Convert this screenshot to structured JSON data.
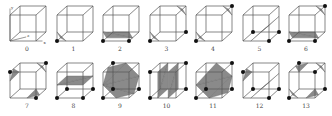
{
  "figure": {
    "axis_labels": {
      "x": "x",
      "y": "y",
      "z": "z"
    },
    "colors": {
      "edge": "#555555",
      "fill": "#8a8a8a",
      "vertex": "#111111",
      "label": "#444444"
    },
    "cases": [
      {
        "label": "0",
        "col": 0,
        "row": 0,
        "vertices": [],
        "tris": []
      },
      {
        "label": "1",
        "col": 1,
        "row": 0,
        "vertices": [
          0
        ],
        "tris": [
          [
            [
              0,
              0.35,
              0
            ],
            [
              0.35,
              0,
              0
            ],
            [
              0,
              0,
              0.35
            ]
          ]
        ]
      },
      {
        "label": "2",
        "col": 2,
        "row": 0,
        "vertices": [
          0,
          1
        ],
        "tris": [
          [
            [
              0,
              0.35,
              0
            ],
            [
              1,
              0.35,
              0
            ],
            [
              1,
              0,
              0.35
            ]
          ],
          [
            [
              0,
              0.35,
              0
            ],
            [
              1,
              0,
              0.35
            ],
            [
              0,
              0,
              0.35
            ]
          ]
        ]
      },
      {
        "label": "3",
        "col": 3,
        "row": 0,
        "vertices": [
          0,
          2
        ],
        "tris": [
          [
            [
              0,
              0.35,
              0
            ],
            [
              0.35,
              0,
              0
            ],
            [
              0,
              0,
              0.35
            ]
          ],
          [
            [
              1,
              0.65,
              1
            ],
            [
              0.65,
              1,
              1
            ],
            [
              1,
              1,
              0.65
            ]
          ]
        ]
      },
      {
        "label": "4",
        "col": 4,
        "row": 0,
        "vertices": [
          0,
          6
        ],
        "tris": [
          [
            [
              0,
              0.35,
              0
            ],
            [
              0.35,
              0,
              0
            ],
            [
              0,
              0,
              0.35
            ]
          ],
          [
            [
              1,
              0.65,
              1
            ],
            [
              0.65,
              1,
              1
            ],
            [
              1,
              1,
              0.65
            ]
          ]
        ]
      },
      {
        "label": "5",
        "col": 5,
        "row": 0,
        "vertices": [
          1,
          2,
          3
        ],
        "tris": [
          [
            [
              0.3,
              0,
              0
            ],
            [
              0.3,
              0,
              1
            ],
            [
              1,
              0.6,
              0
            ]
          ],
          [
            [
              0.3,
              0,
              1
            ],
            [
              1,
              0.6,
              1
            ],
            [
              1,
              0.6,
              0
            ]
          ]
        ]
      },
      {
        "label": "6",
        "col": 6,
        "row": 0,
        "vertices": [
          0,
          1,
          6
        ],
        "tris": [
          [
            [
              0,
              0.35,
              0
            ],
            [
              1,
              0.35,
              0
            ],
            [
              1,
              0,
              0.35
            ]
          ],
          [
            [
              0,
              0.35,
              0
            ],
            [
              1,
              0,
              0.35
            ],
            [
              0,
              0,
              0.35
            ]
          ],
          [
            [
              1,
              0.65,
              1
            ],
            [
              0.65,
              1,
              1
            ],
            [
              1,
              1,
              0.65
            ]
          ]
        ]
      },
      {
        "label": "7",
        "col": 0,
        "row": 1,
        "vertices": [
          1,
          4,
          6
        ],
        "tris": [
          [
            [
              0,
              0.65,
              0
            ],
            [
              0,
              1,
              0.35
            ],
            [
              0.35,
              1,
              0
            ]
          ],
          [
            [
              1,
              0,
              0.35
            ],
            [
              0.65,
              0,
              0
            ],
            [
              1,
              0.35,
              0
            ]
          ],
          [
            [
              1,
              0.65,
              1
            ],
            [
              0.65,
              1,
              1
            ],
            [
              1,
              1,
              0.65
            ]
          ]
        ]
      },
      {
        "label": "8",
        "col": 1,
        "row": 1,
        "vertices": [
          0,
          1,
          2,
          3
        ],
        "tris": [
          [
            [
              0,
              0.5,
              0
            ],
            [
              1,
              0.5,
              0
            ],
            [
              1,
              0.5,
              1
            ]
          ],
          [
            [
              0,
              0.5,
              0
            ],
            [
              1,
              0.5,
              1
            ],
            [
              0,
              0.5,
              1
            ]
          ]
        ]
      },
      {
        "label": "9",
        "col": 2,
        "row": 1,
        "vertices": [
          0,
          2,
          3,
          7
        ],
        "tris": [
          [
            [
              0,
              0.5,
              0
            ],
            [
              0.5,
              0,
              0
            ],
            [
              1,
              0,
              0.5
            ]
          ],
          [
            [
              0,
              0.5,
              0
            ],
            [
              1,
              0,
              0.5
            ],
            [
              1,
              0.5,
              1
            ]
          ],
          [
            [
              0,
              0.5,
              0
            ],
            [
              1,
              0.5,
              1
            ],
            [
              0.5,
              1,
              1
            ]
          ],
          [
            [
              0,
              0.5,
              0
            ],
            [
              0.5,
              1,
              1
            ],
            [
              0,
              1,
              0.5
            ]
          ]
        ]
      },
      {
        "label": "10",
        "col": 3,
        "row": 1,
        "vertices": [
          0,
          4,
          2,
          6
        ],
        "tris": [
          [
            [
              0.3,
              0,
              0
            ],
            [
              0.3,
              1,
              0
            ],
            [
              0.3,
              1,
              1
            ]
          ],
          [
            [
              0.3,
              0,
              0
            ],
            [
              0.3,
              1,
              1
            ],
            [
              0.3,
              0,
              1
            ]
          ],
          [
            [
              0.7,
              0,
              0
            ],
            [
              0.7,
              1,
              0
            ],
            [
              0.7,
              1,
              1
            ]
          ],
          [
            [
              0.7,
              0,
              0
            ],
            [
              0.7,
              1,
              1
            ],
            [
              0.7,
              0,
              1
            ]
          ]
        ]
      },
      {
        "label": "11",
        "col": 4,
        "row": 1,
        "vertices": [
          0,
          2,
          3,
          6
        ],
        "tris": [
          [
            [
              0,
              0.5,
              0
            ],
            [
              0.5,
              0,
              0
            ],
            [
              1,
              0.5,
              1
            ]
          ],
          [
            [
              0,
              0.5,
              0
            ],
            [
              1,
              0.5,
              1
            ],
            [
              0.4,
              1,
              1
            ]
          ],
          [
            [
              0.5,
              0,
              0
            ],
            [
              1,
              0,
              0.6
            ],
            [
              1,
              0.5,
              1
            ]
          ]
        ]
      },
      {
        "label": "12",
        "col": 5,
        "row": 1,
        "vertices": [
          1,
          2,
          3,
          4
        ],
        "tris": [
          [
            [
              0.3,
              0,
              0
            ],
            [
              0.3,
              0,
              1
            ],
            [
              1,
              0.6,
              0
            ]
          ],
          [
            [
              0.3,
              0,
              1
            ],
            [
              1,
              0.6,
              1
            ],
            [
              1,
              0.6,
              0
            ]
          ],
          [
            [
              0,
              0.65,
              0
            ],
            [
              0,
              1,
              0.35
            ],
            [
              0.35,
              1,
              0
            ]
          ]
        ]
      },
      {
        "label": "13",
        "col": 6,
        "row": 1,
        "vertices": [
          0,
          2,
          5,
          7
        ],
        "tris": [
          [
            [
              0,
              0.35,
              0
            ],
            [
              0.35,
              0,
              0
            ],
            [
              0,
              0,
              0.35
            ]
          ],
          [
            [
              1,
              0.65,
              1
            ],
            [
              0.65,
              1,
              1
            ],
            [
              1,
              1,
              0.65
            ]
          ],
          [
            [
              1,
              0.35,
              0
            ],
            [
              0.65,
              0,
              0
            ],
            [
              1,
              0,
              0.35
            ]
          ],
          [
            [
              0,
              0.65,
              1
            ],
            [
              0.35,
              1,
              1
            ],
            [
              0,
              1,
              0.65
            ]
          ]
        ]
      }
    ]
  }
}
